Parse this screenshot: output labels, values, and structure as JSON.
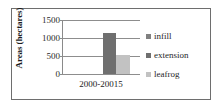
{
  "chart_data": {
    "type": "bar",
    "title": "",
    "xlabel": "",
    "ylabel": "Areas (hectares)",
    "categories": [
      "2000-20015"
    ],
    "series": [
      {
        "name": "infill",
        "values": [
          0
        ],
        "color": "#808080"
      },
      {
        "name": "extension",
        "values": [
          1130
        ],
        "color": "#6f6f6f"
      },
      {
        "name": "leafrog",
        "values": [
          540
        ],
        "color": "#c2c2c2"
      }
    ],
    "ylim": [
      0,
      1500
    ],
    "yticks": [
      0,
      500,
      1000,
      1500
    ],
    "ytick_labels": [
      "0",
      "500",
      "1000",
      "1500"
    ],
    "grid": true,
    "legend_position": "right"
  },
  "legend": {
    "items": [
      {
        "label": "infill"
      },
      {
        "label": "extension"
      },
      {
        "label": "leafrog"
      }
    ]
  }
}
